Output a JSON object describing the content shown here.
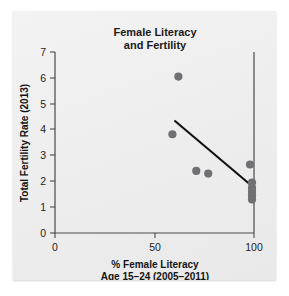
{
  "figure": {
    "panel_background": "#eeeeee",
    "page_background": "#ffffff"
  },
  "chart_data": {
    "type": "scatter",
    "title": "Female Literacy and Fertility",
    "title_lines": [
      "Female Literacy",
      "and Fertility"
    ],
    "xlabel": "% Female Literacy Age 15–24 (2005–2011)",
    "xlabel_lines": [
      "% Female Literacy",
      "Age 15–24 (2005–2011)"
    ],
    "ylabel": "Total Fertility Rate (2013)",
    "xlim": [
      0,
      100
    ],
    "ylim": [
      0,
      7
    ],
    "xticks": [
      0,
      50,
      100
    ],
    "xtick_labels": [
      "0",
      "50",
      "100"
    ],
    "yticks": [
      0,
      1,
      2,
      3,
      4,
      5,
      6,
      7
    ],
    "ytick_labels": [
      "0",
      "1",
      "2",
      "3",
      "4",
      "5",
      "6",
      "7"
    ],
    "grid": false,
    "legend": null,
    "marker_color": "#6f6f74",
    "marker_size": 5,
    "points": [
      {
        "x": 62,
        "y": 6.05
      },
      {
        "x": 59,
        "y": 3.82
      },
      {
        "x": 71,
        "y": 2.4
      },
      {
        "x": 77,
        "y": 2.3
      },
      {
        "x": 98,
        "y": 2.65
      },
      {
        "x": 99,
        "y": 1.95
      },
      {
        "x": 99,
        "y": 1.75
      },
      {
        "x": 99,
        "y": 1.6
      },
      {
        "x": 99,
        "y": 1.45
      },
      {
        "x": 99,
        "y": 1.3
      }
    ],
    "series": [
      {
        "name": "Countries",
        "x": [
          62,
          59,
          71,
          77,
          98,
          99,
          99,
          99,
          99,
          99
        ],
        "values": [
          6.05,
          3.82,
          2.4,
          2.3,
          2.65,
          1.95,
          1.75,
          1.6,
          1.45,
          1.3
        ]
      }
    ],
    "trendline": {
      "type": "line",
      "color": "#111111",
      "x_start": 60,
      "y_start": 4.35,
      "x_end": 100,
      "y_end": 1.75
    }
  }
}
